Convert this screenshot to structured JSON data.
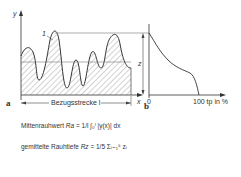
{
  "figure": {
    "panel_a": {
      "label": "a",
      "axis_y_label": "y",
      "axis_x_label": "x",
      "peak_marker": "1",
      "reference_length_label": "Bezugsstrecke l"
    },
    "panel_b": {
      "label": "b",
      "dimension_label": "z",
      "x_start": "0",
      "x_end": "100 tp in %"
    },
    "formulas": [
      {
        "name": "Mittenrauhwert",
        "symbol": "Ra",
        "expression": "= 1/l ∫₀ˡ |y(x)| dx"
      },
      {
        "name": "gemittelte Rauhtiefe",
        "symbol": "Rz",
        "expression": "= 1/5 Σᵢ₌₁⁵ zᵢ"
      }
    ],
    "colors": {
      "line": "#333333",
      "hatch": "#555555",
      "background": "#ffffff"
    }
  }
}
